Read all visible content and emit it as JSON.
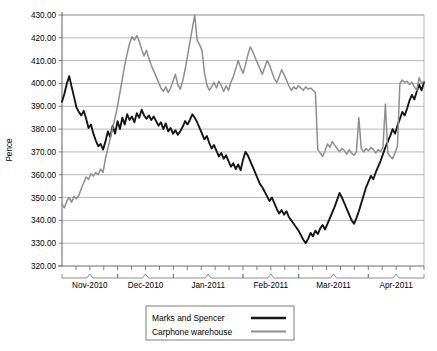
{
  "chart_data": {
    "type": "line",
    "title": "",
    "xlabel": "",
    "ylabel": "Pence",
    "ylim": [
      320.0,
      430.0
    ],
    "ytick_step": 10.0,
    "ytick_labels": [
      "430.00",
      "420.00",
      "410.00",
      "400.00",
      "390.00",
      "380.00",
      "370.00",
      "360.00",
      "350.00",
      "340.00",
      "330.00",
      "320.00"
    ],
    "ytick_values": [
      430.0,
      420.0,
      410.0,
      400.0,
      390.0,
      380.0,
      370.0,
      360.0,
      350.0,
      340.0,
      330.0,
      320.0
    ],
    "grid": true,
    "legend_position": "bottom-center",
    "x_groups": [
      "Nov-2010",
      "Dec-2010",
      "Jan-2011",
      "Feb-2011",
      "Mar-2011",
      "Apr-2011"
    ],
    "x_group_tick_counts": [
      4,
      4,
      5,
      4,
      5,
      4
    ],
    "x_tick_interval": "weekly",
    "series": [
      {
        "name": "Marks and Spencer",
        "color": "#161616",
        "width": 1.9,
        "values": [
          392.0,
          395.5,
          400.0,
          403.2,
          398.5,
          394.0,
          389.5,
          387.5,
          386.0,
          388.0,
          384.5,
          380.5,
          382.0,
          378.0,
          375.0,
          372.5,
          373.5,
          371.0,
          374.5,
          379.0,
          376.5,
          381.5,
          378.0,
          383.5,
          380.0,
          385.0,
          382.0,
          386.5,
          384.0,
          385.5,
          383.0,
          387.0,
          385.0,
          388.5,
          386.0,
          384.5,
          386.0,
          384.0,
          385.5,
          383.5,
          381.5,
          383.0,
          380.0,
          382.5,
          379.0,
          380.5,
          378.0,
          379.5,
          377.5,
          379.0,
          381.0,
          383.5,
          382.0,
          384.0,
          386.5,
          385.0,
          383.0,
          380.5,
          378.0,
          375.5,
          377.0,
          374.0,
          371.5,
          373.0,
          370.5,
          368.0,
          369.5,
          367.0,
          368.5,
          366.0,
          363.5,
          365.0,
          362.5,
          364.5,
          362.0,
          366.5,
          370.0,
          368.5,
          366.0,
          363.5,
          361.0,
          358.5,
          356.0,
          354.5,
          352.5,
          350.5,
          348.5,
          350.0,
          347.5,
          345.0,
          343.0,
          344.5,
          342.5,
          344.0,
          341.5,
          340.0,
          338.5,
          337.0,
          335.5,
          333.5,
          331.5,
          330.0,
          332.0,
          334.5,
          333.0,
          335.5,
          334.0,
          336.5,
          338.0,
          336.0,
          338.5,
          341.0,
          343.5,
          346.0,
          349.0,
          352.0,
          350.0,
          347.5,
          345.0,
          342.5,
          340.0,
          338.5,
          341.0,
          344.0,
          347.5,
          351.0,
          354.5,
          357.0,
          359.5,
          358.0,
          361.0,
          363.5,
          366.0,
          369.0,
          372.0,
          374.5,
          377.0,
          380.0,
          378.0,
          381.5,
          384.5,
          387.5,
          386.0,
          389.0,
          392.5,
          395.0,
          393.0,
          396.5,
          399.5,
          397.0,
          400.5
        ]
      },
      {
        "name": "Carphone warehouse",
        "color": "#8e8e8e",
        "width": 1.5,
        "values": [
          347.0,
          345.5,
          348.5,
          350.0,
          348.0,
          350.5,
          349.5,
          351.0,
          354.0,
          356.5,
          359.0,
          358.0,
          360.5,
          359.5,
          361.0,
          360.0,
          362.5,
          361.0,
          367.0,
          371.5,
          376.0,
          380.5,
          385.0,
          390.0,
          396.0,
          402.0,
          408.0,
          413.0,
          417.5,
          420.5,
          419.0,
          421.0,
          418.5,
          415.0,
          412.0,
          414.5,
          411.0,
          408.0,
          405.5,
          403.0,
          400.5,
          398.0,
          396.5,
          398.5,
          396.0,
          398.0,
          401.0,
          404.0,
          399.5,
          397.5,
          401.0,
          406.0,
          412.0,
          418.0,
          424.0,
          430.0,
          419.0,
          417.0,
          414.5,
          405.0,
          399.5,
          397.0,
          398.5,
          400.5,
          398.0,
          401.0,
          399.0,
          396.5,
          399.0,
          397.0,
          400.5,
          403.0,
          406.5,
          410.0,
          407.0,
          404.5,
          408.0,
          412.5,
          416.0,
          414.0,
          411.5,
          409.0,
          406.5,
          404.0,
          407.0,
          410.0,
          408.0,
          405.0,
          402.0,
          400.5,
          403.0,
          406.0,
          404.0,
          401.5,
          399.0,
          397.0,
          398.5,
          397.5,
          399.0,
          398.0,
          397.0,
          398.5,
          397.5,
          398.0,
          397.0,
          396.0,
          371.0,
          369.5,
          368.0,
          370.5,
          373.5,
          372.0,
          374.5,
          373.0,
          371.5,
          370.0,
          371.5,
          370.5,
          369.0,
          371.0,
          369.5,
          368.5,
          370.0,
          385.0,
          371.5,
          370.0,
          371.5,
          370.5,
          372.0,
          371.0,
          369.5,
          371.0,
          370.0,
          372.0,
          391.0,
          369.5,
          368.0,
          367.0,
          369.5,
          372.5,
          400.0,
          401.5,
          400.5,
          401.0,
          399.5,
          400.5,
          398.5,
          397.0,
          402.5,
          400.0,
          401.0
        ]
      }
    ]
  },
  "legend": {
    "items": [
      {
        "label": "Marks and Spencer",
        "color": "#161616",
        "width": 2.6
      },
      {
        "label": "Carphone warehouse",
        "color": "#8e8e8e",
        "width": 1.8
      }
    ]
  }
}
